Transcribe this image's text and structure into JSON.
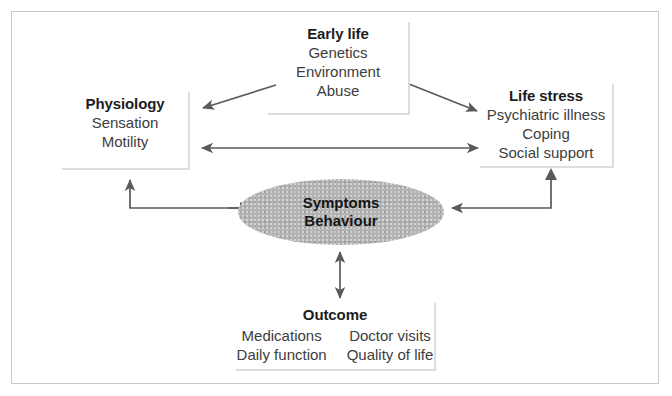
{
  "diagram": {
    "type": "biopsychosocial-model-flow-diagram",
    "nodes": {
      "early_life": {
        "title": "Early life",
        "items": [
          "Genetics",
          "Environment",
          "Abuse"
        ]
      },
      "physiology": {
        "title": "Physiology",
        "items": [
          "Sensation",
          "Motility"
        ]
      },
      "life_stress": {
        "title": "Life stress",
        "items": [
          "Psychiatric illness",
          "Coping",
          "Social support"
        ]
      },
      "symptoms": {
        "line1": "Symptoms",
        "line2": "Behaviour"
      },
      "outcome": {
        "title": "Outcome",
        "column_left": [
          "Medications",
          "Daily function"
        ],
        "column_right": [
          "Doctor visits",
          "Quality of life"
        ]
      }
    },
    "connectors": [
      {
        "name": "early-life-to-physiology",
        "from": "early_life",
        "to": "physiology",
        "direction": "single",
        "style": "diagonal"
      },
      {
        "name": "early-life-to-life-stress",
        "from": "early_life",
        "to": "life_stress",
        "direction": "single",
        "style": "diagonal"
      },
      {
        "name": "physiology-to-life-stress",
        "from": "physiology",
        "to": "life_stress",
        "direction": "double",
        "style": "horizontal"
      },
      {
        "name": "symptoms-to-physiology",
        "from": "symptoms",
        "to": "physiology",
        "direction": "single",
        "style": "elbow"
      },
      {
        "name": "life-stress-to-symptoms",
        "from": "life_stress",
        "to": "symptoms",
        "direction": "single",
        "style": "elbow"
      },
      {
        "name": "symptoms-to-outcome",
        "from": "symptoms",
        "to": "outcome",
        "direction": "double",
        "style": "vertical"
      }
    ],
    "colors": {
      "frame_border": "#c9c9c9",
      "box_rule": "#dcdcdc",
      "arrow": "#5a5a5a",
      "ellipse_fill": "#b3b3b3",
      "title_text": "#1d1d1d",
      "body_text": "#3d3d3d",
      "background": "#ffffff"
    }
  }
}
